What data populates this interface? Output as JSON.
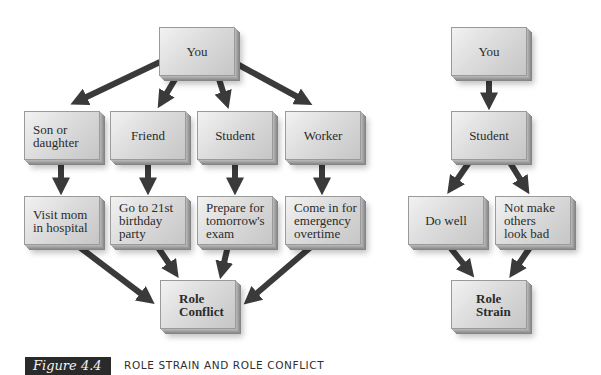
{
  "role_conflict": {
    "root": "You",
    "roles": [
      "Son or\ndaughter",
      "Friend",
      "Student",
      "Worker"
    ],
    "demands": [
      "Visit mom\nin hospital",
      "Go to 21st\nbirthday\nparty",
      "Prepare for\ntomorrow's\nexam",
      "Come in for\nemergency\novertime"
    ],
    "result": "Role\nConflict"
  },
  "role_strain": {
    "root": "You",
    "role": "Student",
    "demands": [
      "Do well",
      "Not make\nothers\nlook bad"
    ],
    "result": "Role\nStrain"
  },
  "figure": {
    "label": "Figure 4.4",
    "caption": "ROLE STRAIN AND ROLE CONFLICT"
  },
  "colors": {
    "arrow": "#3a3a3a",
    "box_light": "#f2f2f2",
    "box_dark": "#c6c6c6",
    "label_bg": "#2a2a2a"
  }
}
